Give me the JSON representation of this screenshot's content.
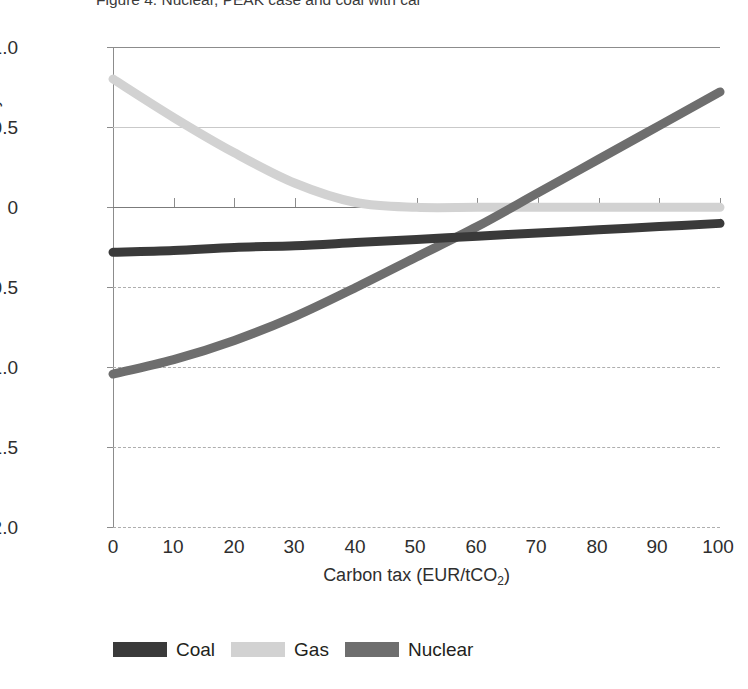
{
  "figure": {
    "title": "Figure 4. Nuclear, PEAK case and coal with car",
    "title_visible_fragment": "...rate, PEAK case and coal with car"
  },
  "axes": {
    "y_title": "Proftability index",
    "x_title_main": "Carbon tax (EUR/tCO",
    "x_title_sub": "2",
    "x_title_tail": ")",
    "y_ticks": [
      "1.0",
      "0.5",
      "0",
      "-0.5",
      "-1.0",
      "-1.5",
      "-2.0"
    ],
    "x_ticks": [
      "0",
      "10",
      "20",
      "30",
      "40",
      "50",
      "60",
      "70",
      "80",
      "90",
      "100"
    ]
  },
  "legend": {
    "items": [
      {
        "label": "Coal",
        "color": "#3a3a3a"
      },
      {
        "label": "Gas",
        "color": "#d2d2d2"
      },
      {
        "label": "Nuclear",
        "color": "#6e6e6e"
      }
    ]
  },
  "colors": {
    "coal": "#3a3a3a",
    "gas": "#d2d2d2",
    "nuclear": "#6e6e6e",
    "axis": "#8c8c8c",
    "grid_solid": "#c9c9c9",
    "grid_dashed": "#aeaeae",
    "text": "#231f20"
  },
  "chart_data": {
    "type": "line",
    "title": "Figure 4. Nuclear, PEAK case and coal with car",
    "xlabel": "Carbon tax (EUR/tCO2)",
    "ylabel": "Proftability index",
    "xlim": [
      0,
      100
    ],
    "ylim": [
      -2.0,
      1.0
    ],
    "yticks": [
      1.0,
      0.5,
      0,
      -0.5,
      -1.0,
      -1.5,
      -2.0
    ],
    "xticks": [
      0,
      10,
      20,
      30,
      40,
      50,
      60,
      70,
      80,
      90,
      100
    ],
    "grid": "horizontal",
    "legend_position": "bottom-left",
    "x": [
      0,
      10,
      20,
      30,
      40,
      50,
      60,
      70,
      80,
      90,
      100
    ],
    "series": [
      {
        "name": "Coal",
        "color": "#3a3a3a",
        "values": [
          -0.28,
          -0.27,
          -0.25,
          -0.24,
          -0.22,
          -0.2,
          -0.18,
          -0.16,
          -0.14,
          -0.12,
          -0.1
        ]
      },
      {
        "name": "Gas",
        "color": "#d2d2d2",
        "values": [
          0.8,
          0.56,
          0.34,
          0.15,
          0.03,
          0.0,
          0.0,
          0.0,
          0.0,
          0.0,
          0.0
        ]
      },
      {
        "name": "Nuclear",
        "color": "#6e6e6e",
        "values": [
          -1.04,
          -0.95,
          -0.83,
          -0.68,
          -0.5,
          -0.31,
          -0.12,
          0.09,
          0.3,
          0.51,
          0.72
        ]
      }
    ]
  }
}
